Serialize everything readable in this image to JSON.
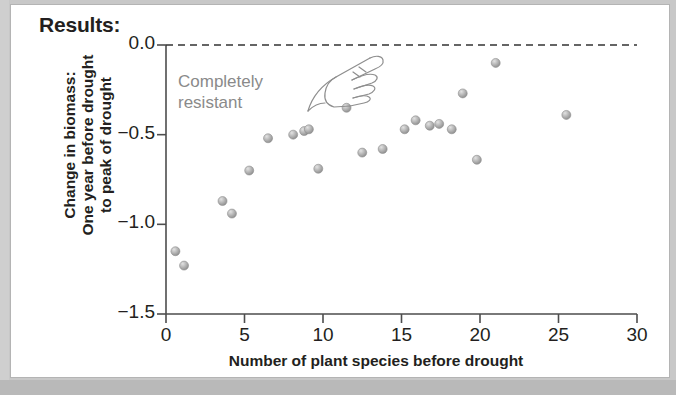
{
  "figure": {
    "title": "Results:",
    "frame_color": "#c8c8c8",
    "panel_color": "#ffffff"
  },
  "annotation": {
    "text": "Completely\nresistant",
    "color": "#8a8a8a",
    "icon": "pointing-hand-icon"
  },
  "chart_data": {
    "type": "scatter",
    "title": "Results:",
    "xlabel": "Number of plant species before drought",
    "ylabel": "Change in biomass: One year before drought to peak of drought",
    "ylabel_lines": [
      "Change in biomass:",
      "One year before drought",
      "to peak of drought"
    ],
    "xlim": [
      0,
      30
    ],
    "ylim": [
      -1.5,
      0.0
    ],
    "xticks": [
      0,
      5,
      10,
      15,
      20,
      25,
      30
    ],
    "xtick_labels": [
      "0",
      "5",
      "10",
      "15",
      "20",
      "25",
      "30"
    ],
    "yticks": [
      0.0,
      -0.5,
      -1.0,
      -1.5
    ],
    "ytick_labels": [
      "0.0",
      "−0.5",
      "−1.0",
      "−1.5"
    ],
    "grid": false,
    "legend": null,
    "reference_line": {
      "y": 0.0,
      "style": "dashed",
      "color": "#333333",
      "label": "Completely resistant"
    },
    "marker": {
      "shape": "circle",
      "color": "#a8a8a8",
      "edge_color": "#8f8f8f",
      "size": 9
    },
    "points": [
      {
        "x": 0.6,
        "y": -1.15
      },
      {
        "x": 1.15,
        "y": -1.23
      },
      {
        "x": 3.6,
        "y": -0.87
      },
      {
        "x": 4.2,
        "y": -0.94
      },
      {
        "x": 5.3,
        "y": -0.7
      },
      {
        "x": 6.5,
        "y": -0.52
      },
      {
        "x": 8.1,
        "y": -0.5
      },
      {
        "x": 8.8,
        "y": -0.48
      },
      {
        "x": 9.1,
        "y": -0.47
      },
      {
        "x": 9.7,
        "y": -0.69
      },
      {
        "x": 11.5,
        "y": -0.35
      },
      {
        "x": 12.5,
        "y": -0.6
      },
      {
        "x": 13.8,
        "y": -0.58
      },
      {
        "x": 15.2,
        "y": -0.47
      },
      {
        "x": 15.9,
        "y": -0.42
      },
      {
        "x": 16.8,
        "y": -0.45
      },
      {
        "x": 17.4,
        "y": -0.44
      },
      {
        "x": 18.2,
        "y": -0.47
      },
      {
        "x": 18.9,
        "y": -0.27
      },
      {
        "x": 19.8,
        "y": -0.64
      },
      {
        "x": 21.0,
        "y": -0.1
      },
      {
        "x": 25.5,
        "y": -0.39
      }
    ]
  }
}
